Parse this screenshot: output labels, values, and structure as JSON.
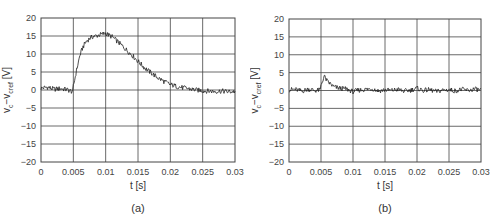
{
  "chart_data": [
    {
      "type": "line",
      "panel": "(a)",
      "xlabel": "t [s]",
      "ylabel": "v_c − v_cref [V]",
      "xlim": [
        0,
        0.03
      ],
      "ylim": [
        -20,
        20
      ],
      "xticks": [
        "0",
        "0.005",
        "0.01",
        "0.015",
        "0.02",
        "0.025",
        "0.03"
      ],
      "yticks": [
        "20",
        "15",
        "10",
        "5",
        "0",
        "−5",
        "−10",
        "−15",
        "−20"
      ],
      "grid": true,
      "series": [
        {
          "name": "v_c - v_cref",
          "x": [
            0,
            0.001,
            0.002,
            0.003,
            0.004,
            0.0049,
            0.005,
            0.0055,
            0.006,
            0.0065,
            0.007,
            0.0075,
            0.008,
            0.0085,
            0.009,
            0.0095,
            0.01,
            0.0105,
            0.011,
            0.012,
            0.013,
            0.014,
            0.015,
            0.016,
            0.017,
            0.018,
            0.019,
            0.02,
            0.021,
            0.022,
            0.023,
            0.024,
            0.025,
            0.026,
            0.027,
            0.028,
            0.029,
            0.03
          ],
          "y": [
            0.5,
            0.8,
            0.2,
            0.4,
            0.1,
            -0.5,
            1.0,
            5.5,
            9.5,
            12.0,
            13.5,
            14.3,
            14.8,
            15.0,
            15.3,
            15.5,
            15.8,
            15.2,
            14.8,
            13.2,
            11.5,
            9.8,
            8.0,
            6.2,
            4.8,
            3.5,
            2.4,
            1.5,
            1.0,
            0.6,
            0.3,
            0.0,
            -0.2,
            -0.3,
            -0.4,
            -0.3,
            -0.5,
            -0.4
          ]
        }
      ]
    },
    {
      "type": "line",
      "panel": "(b)",
      "xlabel": "t [s]",
      "ylabel": "v_c − v_cref [V]",
      "xlim": [
        0,
        0.03
      ],
      "ylim": [
        -20,
        20
      ],
      "xticks": [
        "0",
        "0.005",
        "0.01",
        "0.015",
        "0.02",
        "0.025",
        "0.03"
      ],
      "yticks": [
        "20",
        "15",
        "10",
        "5",
        "0",
        "−5",
        "−10",
        "−15",
        "−20"
      ],
      "grid": true,
      "series": [
        {
          "name": "v_c - v_cref",
          "x": [
            0,
            0.001,
            0.002,
            0.003,
            0.004,
            0.0049,
            0.005,
            0.0055,
            0.006,
            0.0065,
            0.007,
            0.008,
            0.009,
            0.01,
            0.011,
            0.012,
            0.013,
            0.014,
            0.015,
            0.016,
            0.017,
            0.018,
            0.019,
            0.02,
            0.021,
            0.022,
            0.023,
            0.024,
            0.025,
            0.026,
            0.027,
            0.028,
            0.029,
            0.03
          ],
          "y": [
            0.2,
            0.3,
            -0.2,
            0.4,
            0.0,
            0.1,
            1.5,
            4.0,
            2.5,
            1.8,
            1.0,
            0.6,
            0.4,
            -0.3,
            0.1,
            0.3,
            0.5,
            -0.1,
            0.2,
            0.0,
            0.3,
            -0.2,
            0.1,
            0.6,
            0.0,
            0.2,
            -0.3,
            0.1,
            0.2,
            -0.1,
            0.3,
            0.0,
            0.4,
            0.1
          ]
        }
      ]
    }
  ],
  "labels": {
    "xlabel": "t [s]",
    "ylabel_main": "v",
    "ylabel_sub1": "c",
    "ylabel_mid": "−v",
    "ylabel_sub2": "cref",
    "ylabel_unit": " [V]",
    "caption_a": "(a)",
    "caption_b": "(b)"
  },
  "colors": {
    "line": "#222222",
    "grid": "#444444",
    "axis": "#444444"
  }
}
